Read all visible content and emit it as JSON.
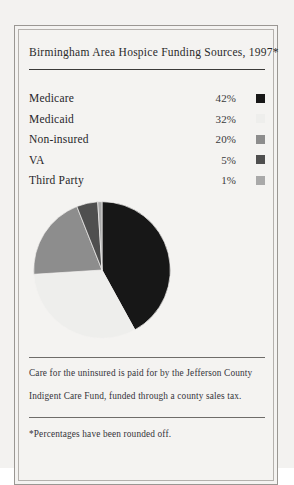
{
  "card": {
    "title": "Birmingham Area Hospice Funding Sources, 1997*",
    "caption_line_1": "Care for the uninsured is paid for by the Jefferson County",
    "caption_line_2": "Indigent Care Fund, funded through a county sales tax.",
    "footnote": "*Percentages have been rounded off."
  },
  "legend": {
    "rows": [
      {
        "label": "Medicare",
        "pct": "42%",
        "color": "#171717"
      },
      {
        "label": "Medicaid",
        "pct": "32%",
        "color": "#eeeeec"
      },
      {
        "label": "Non-insured",
        "pct": "20%",
        "color": "#8d8d8d"
      },
      {
        "label": "VA",
        "pct": "5%",
        "color": "#4f4f4f"
      },
      {
        "label": "Third Party",
        "pct": "1%",
        "color": "#a9a9a9"
      }
    ]
  },
  "chart_data": {
    "type": "pie",
    "title": "Birmingham Area Hospice Funding Sources, 1997*",
    "labels": [
      "Medicare",
      "Medicaid",
      "Non-insured",
      "VA",
      "Third Party"
    ],
    "values": [
      42,
      32,
      20,
      5,
      1
    ],
    "value_labels": [
      "42%",
      "32%",
      "20%",
      "5%",
      "1%"
    ],
    "colors": [
      "#171717",
      "#eeeeec",
      "#8d8d8d",
      "#4f4f4f",
      "#a9a9a9"
    ],
    "units": "percent",
    "total": 100,
    "start_angle_deg": 0,
    "direction": "clockwise",
    "legend": "top",
    "grid": false,
    "note": "*Percentages have been rounded off."
  }
}
